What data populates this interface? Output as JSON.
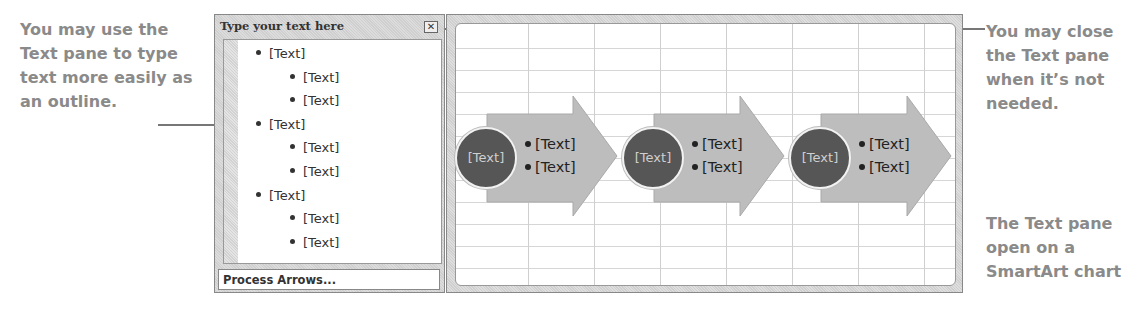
{
  "callouts": {
    "left": "You may use the Text pane to type text more easily as an outline.",
    "right_top": "You may close the Text pane when it’s not needed.",
    "right_bottom": "The Text pane open on a SmartArt chart"
  },
  "text_pane": {
    "title": "Type your text here",
    "close_icon": "close-icon",
    "items": [
      {
        "level": 1,
        "text": "[Text]"
      },
      {
        "level": 2,
        "text": "[Text]"
      },
      {
        "level": 2,
        "text": "[Text]"
      },
      {
        "level": 1,
        "text": "[Text]"
      },
      {
        "level": 2,
        "text": "[Text]"
      },
      {
        "level": 2,
        "text": "[Text]"
      },
      {
        "level": 1,
        "text": "[Text]"
      },
      {
        "level": 2,
        "text": "[Text]"
      },
      {
        "level": 2,
        "text": "[Text]"
      }
    ],
    "footer": "Process Arrows..."
  },
  "smartart": {
    "layout": "Process Arrows",
    "colors": {
      "circle": "#565656",
      "arrow": "#bdbdbd",
      "grid": "#cfcfcf"
    },
    "steps": [
      {
        "label": "[Text]",
        "bullets": [
          "[Text]",
          "[Text]"
        ]
      },
      {
        "label": "[Text]",
        "bullets": [
          "[Text]",
          "[Text]"
        ]
      },
      {
        "label": "[Text]",
        "bullets": [
          "[Text]",
          "[Text]"
        ]
      }
    ]
  }
}
